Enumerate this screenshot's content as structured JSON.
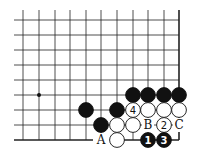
{
  "diagram": {
    "type": "go-board-fragment",
    "grid": {
      "columns_x": [
        23,
        39,
        55,
        70,
        86,
        101,
        117,
        133,
        148,
        164,
        179
      ],
      "rows_y": [
        20,
        35,
        50,
        65,
        80,
        95,
        110,
        125,
        140
      ],
      "left_extent_x": 14,
      "top_extent_y": 10,
      "right_edge_col": 10,
      "bottom_edge_row": 8,
      "line_color": "#222222"
    },
    "star_points": [
      {
        "col": 1,
        "row": 5
      }
    ],
    "stones": [
      {
        "color": "black",
        "col": 7,
        "row": 5,
        "label": ""
      },
      {
        "color": "black",
        "col": 8,
        "row": 5,
        "label": ""
      },
      {
        "color": "black",
        "col": 9,
        "row": 5,
        "label": ""
      },
      {
        "color": "black",
        "col": 10,
        "row": 5,
        "label": ""
      },
      {
        "color": "black",
        "col": 4,
        "row": 6,
        "label": ""
      },
      {
        "color": "black",
        "col": 6,
        "row": 6,
        "label": ""
      },
      {
        "color": "white",
        "col": 7,
        "row": 6,
        "label": "4"
      },
      {
        "color": "white",
        "col": 8,
        "row": 6,
        "label": ""
      },
      {
        "color": "white",
        "col": 9,
        "row": 6,
        "label": ""
      },
      {
        "color": "white",
        "col": 10,
        "row": 6,
        "label": ""
      },
      {
        "color": "black",
        "col": 5,
        "row": 7,
        "label": ""
      },
      {
        "color": "white",
        "col": 6,
        "row": 7,
        "label": ""
      },
      {
        "color": "white",
        "col": 7,
        "row": 7,
        "label": ""
      },
      {
        "color": "white",
        "col": 9,
        "row": 7,
        "label": "2"
      },
      {
        "color": "white",
        "col": 6,
        "row": 8,
        "label": ""
      },
      {
        "color": "black",
        "col": 8,
        "row": 8,
        "label": "1"
      },
      {
        "color": "black",
        "col": 9,
        "row": 8,
        "label": "3"
      }
    ],
    "letters": [
      {
        "text": "B",
        "col": 8,
        "row": 7
      },
      {
        "text": "C",
        "col": 10,
        "row": 7
      },
      {
        "text": "A",
        "col": 5,
        "row": 8
      }
    ]
  }
}
